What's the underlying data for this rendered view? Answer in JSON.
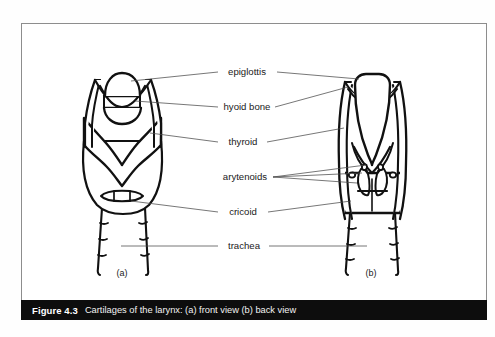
{
  "figure": {
    "caption_number": "Figure 4.3",
    "caption_text": "Cartilages of the larynx: (a) front view (b) back view",
    "frame_border_color": "#8d8d8d",
    "caption_bar_color": "#0d0d0d",
    "caption_text_color": "#ffffff",
    "ink_color": "#111111",
    "leader_color": "#4a4a4a",
    "background_color": "#ffffff"
  },
  "labels": [
    {
      "id": "epiglottis",
      "text": "epiglottis",
      "x": 247,
      "y": 72,
      "leads_left": true,
      "leads_right": true
    },
    {
      "id": "hyoid-bone",
      "text": "hyoid bone",
      "x": 247,
      "y": 107,
      "leads_left": true,
      "leads_right": true
    },
    {
      "id": "thyroid",
      "text": "thyroid",
      "x": 247,
      "y": 142,
      "leads_left": true,
      "leads_right": true
    },
    {
      "id": "arytenoids",
      "text": "arytenoids",
      "x": 247,
      "y": 177,
      "leads_left": false,
      "leads_right": true
    },
    {
      "id": "cricoid",
      "text": "cricoid",
      "x": 247,
      "y": 212,
      "leads_left": true,
      "leads_right": true
    },
    {
      "id": "trachea",
      "text": "trachea",
      "x": 247,
      "y": 246,
      "leads_left": true,
      "leads_right": true
    }
  ],
  "views": [
    {
      "id": "front-view",
      "sublabel": "(a)",
      "x": 122,
      "y": 273
    },
    {
      "id": "back-view",
      "sublabel": "(b)",
      "x": 371,
      "y": 273
    }
  ],
  "structures": {
    "front": [
      "epiglottis",
      "hyoid bone",
      "thyroid cartilage",
      "cricothyroid membrane",
      "cricoid cartilage",
      "trachea rings"
    ],
    "back": [
      "epiglottis",
      "hyoid bone",
      "thyroid cartilage",
      "arytenoid cartilages",
      "cricoid cartilage",
      "trachea rings"
    ]
  }
}
